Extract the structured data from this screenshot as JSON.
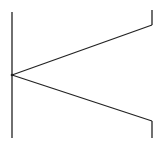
{
  "diagram": {
    "type": "line-drawing",
    "stroke_color": "#222222",
    "background": "#ffffff",
    "lines": [
      {
        "name": "left-vertical-line",
        "x1": 12,
        "y1": 12,
        "x2": 12,
        "y2": 138
      },
      {
        "name": "upper-diagonal-line",
        "x1": 12,
        "y1": 75,
        "x2": 152,
        "y2": 25
      },
      {
        "name": "upper-right-vertical-line",
        "x1": 152,
        "y1": 25,
        "x2": 152,
        "y2": 10
      },
      {
        "name": "lower-diagonal-line",
        "x1": 12,
        "y1": 75,
        "x2": 152,
        "y2": 121
      },
      {
        "name": "lower-right-vertical-line",
        "x1": 152,
        "y1": 121,
        "x2": 152,
        "y2": 138
      }
    ],
    "vertex": {
      "x": 12,
      "y": 75
    }
  }
}
